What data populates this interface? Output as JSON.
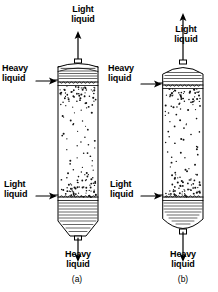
{
  "figure": {
    "line_color": "#000000",
    "droplet_color": "#1a1a1a",
    "background": "#ffffff"
  },
  "panels": [
    {
      "id": "a",
      "caption": "(a)",
      "vessel_shape": "flat-top cylindrical with conical bottom",
      "labels": {
        "top_outlet": "Light\nliquid",
        "top_inlet": "Heavy\nliquid",
        "bottom_inlet": "Light\nliquid",
        "bottom_outlet": "Heavy\nliquid"
      }
    },
    {
      "id": "b",
      "caption": "(b)",
      "vessel_shape": "domed top with rounded bottom",
      "labels": {
        "top_outlet": "Light\nliquid",
        "top_inlet": "Heavy\nliquid",
        "bottom_inlet": "Light\nliquid",
        "bottom_outlet": "Heavy\nliquid"
      }
    }
  ]
}
